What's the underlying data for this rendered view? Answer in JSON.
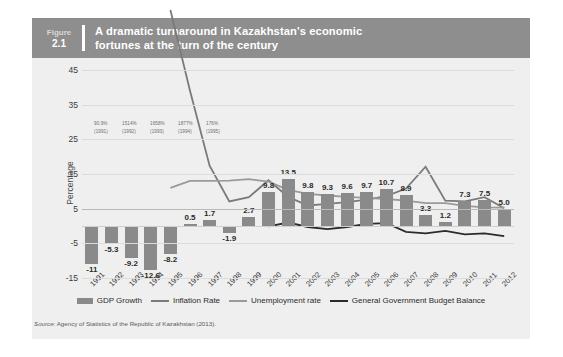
{
  "figure": {
    "label": "Figure",
    "number": "2.1",
    "title_line1": "A dramatic turnaround in Kazakhstan's economic",
    "title_line2": "fortunes at the turn of the century",
    "header_color": "#8e8e8e",
    "panel_color": "#efefef"
  },
  "source": {
    "prefix": "Source:",
    "text": "Agency of Statistics of the Republic of Kazakhstan (2013)."
  },
  "annotation": {
    "values": [
      "90.9%",
      "1514%",
      "1658%",
      "1877%",
      "176%"
    ],
    "years": [
      "(1991)",
      "(1992)",
      "(1993)",
      "(1994)",
      "(1995)"
    ]
  },
  "chart_data": {
    "type": "bar",
    "title": "A dramatic turnaround in Kazakhstan's economic fortunes at the turn of the century",
    "xlabel": "",
    "ylabel": "Percentage",
    "ylim": [
      -15,
      45
    ],
    "yticks": [
      45,
      35,
      25,
      15,
      5,
      -5,
      -15
    ],
    "grid": true,
    "legend_position": "bottom",
    "categories": [
      "1991",
      "1992",
      "1993",
      "1994",
      "1995",
      "1996",
      "1997",
      "1998",
      "1999",
      "2000",
      "2001",
      "2002",
      "2003",
      "2004",
      "2005",
      "2006",
      "2007",
      "2008",
      "2009",
      "2010",
      "2011",
      "2012"
    ],
    "series": [
      {
        "name": "GDP Growth",
        "type": "bar",
        "color": "#8a8a8a",
        "values": [
          -11,
          -5.3,
          -9.2,
          -12.6,
          -8.2,
          0.5,
          1.7,
          -1.9,
          2.7,
          9.8,
          13.5,
          9.8,
          9.3,
          9.6,
          9.7,
          10.7,
          8.9,
          3.3,
          1.2,
          7.3,
          7.5,
          5.0
        ],
        "labels": [
          "-11",
          "-5.3",
          "-9.2",
          "-12.6",
          "-8.2",
          "0.5",
          "1.7",
          "-1.9",
          "2.7",
          "9.8",
          "13.5",
          "9.8",
          "9.3",
          "9.6",
          "9.7",
          "10.7",
          "8.9",
          "3.3",
          "1.2",
          "7.3",
          "7.5",
          "5.0"
        ]
      },
      {
        "name": "Inflation Rate",
        "type": "line",
        "color": "#7a7a7a",
        "values": [
          null,
          null,
          null,
          null,
          176,
          39,
          17.4,
          7.1,
          8.3,
          13.2,
          8.4,
          5.9,
          6.4,
          6.9,
          7.6,
          8.6,
          10.8,
          17.1,
          7.3,
          7.1,
          8.3,
          5.1
        ]
      },
      {
        "name": "Unemployment rate",
        "type": "line",
        "color": "#9a9a9a",
        "values": [
          null,
          null,
          null,
          null,
          11.0,
          13.0,
          13.0,
          13.1,
          13.5,
          12.8,
          10.4,
          9.3,
          8.8,
          8.4,
          8.1,
          7.8,
          7.3,
          6.6,
          6.6,
          5.8,
          5.4,
          5.3
        ]
      },
      {
        "name": "General Government Budget Balance",
        "type": "line",
        "color": "#2b2b2b",
        "values": [
          null,
          null,
          null,
          null,
          null,
          null,
          null,
          null,
          null,
          -0.1,
          1.0,
          -0.3,
          -0.9,
          -0.3,
          0.6,
          0.8,
          -1.7,
          -2.1,
          -1.4,
          -2.4,
          -2.1,
          -2.9
        ]
      }
    ]
  },
  "legend": {
    "items": [
      {
        "label": "GDP Growth",
        "marker": "bar",
        "color": "#8a8a8a"
      },
      {
        "label": "Inflation Rate",
        "marker": "line",
        "color": "#7a7a7a"
      },
      {
        "label": "Unemployment rate",
        "marker": "line",
        "color": "#9a9a9a"
      },
      {
        "label": "General Government Budget Balance",
        "marker": "line",
        "color": "#2b2b2b"
      }
    ]
  }
}
